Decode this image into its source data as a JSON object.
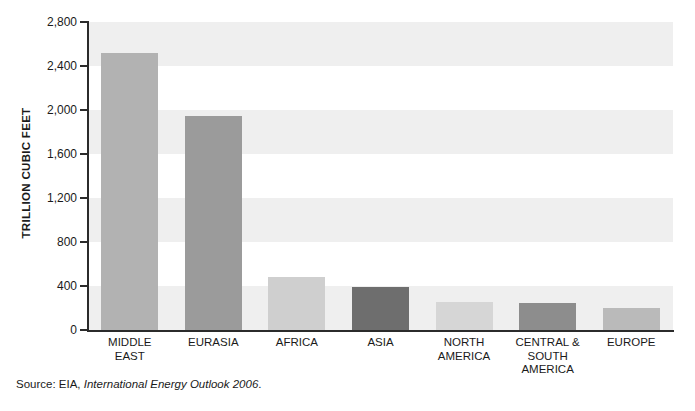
{
  "chart_data": {
    "type": "bar",
    "title": "",
    "subtitle": "",
    "xlabel": "",
    "ylabel": "TRILLION CUBIC FEET",
    "categories": [
      "MIDDLE\nEAST",
      "EURASIA",
      "AFRICA",
      "ASIA",
      "NORTH\nAMERICA",
      "CENTRAL &\nSOUTH\nAMERICA",
      "EUROPE"
    ],
    "values": [
      2520,
      1950,
      480,
      390,
      255,
      245,
      200
    ],
    "bar_colors": [
      "#b2b2b2",
      "#9b9b9b",
      "#cfcfcf",
      "#6e6e6e",
      "#d6d6d6",
      "#8d8d8d",
      "#bababa"
    ],
    "ylim": [
      0,
      2800
    ],
    "yticks": [
      0,
      400,
      800,
      1200,
      1600,
      2000,
      2400,
      2800
    ],
    "ytick_labels": [
      "0",
      "400",
      "800",
      "1,200",
      "1,600",
      "2,000",
      "2,400",
      "2,800"
    ],
    "grid": false,
    "banded_background": true,
    "band_color": "#efefef",
    "band_ranges": [
      [
        0,
        400
      ],
      [
        800,
        1200
      ],
      [
        1600,
        2000
      ],
      [
        2400,
        2800
      ]
    ],
    "legend": null,
    "legend_position": "none",
    "annotations": []
  },
  "source": {
    "prefix": "Source: EIA, ",
    "title": "International Energy Outlook 2006",
    "suffix": "."
  }
}
